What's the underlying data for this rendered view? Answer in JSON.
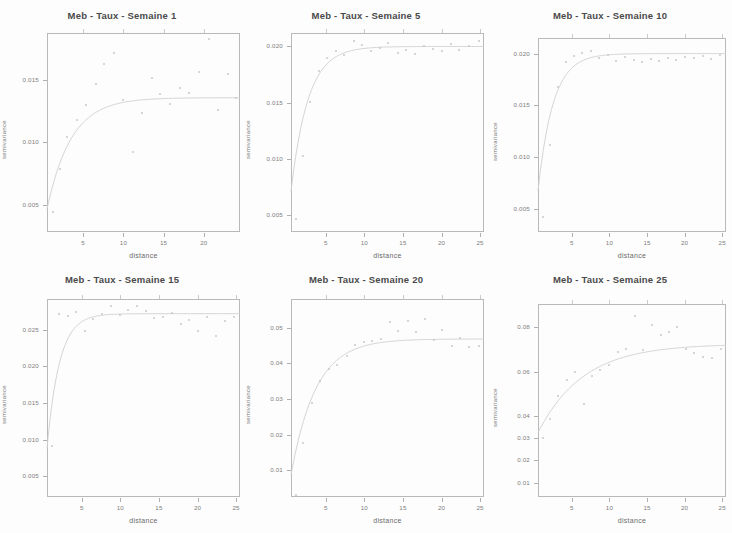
{
  "figure": {
    "background_color": "#fdfdfd",
    "layout": {
      "rows": 2,
      "cols": 3
    },
    "axis_color": "#b9b9b9",
    "point_color": "#c9c9c9",
    "line_color": "#cfcfcf"
  },
  "chart_data": [
    {
      "type": "scatter",
      "title": "Meb - Taux - Semaine 1",
      "xlabel": "distance",
      "ylabel": "semivariance",
      "xticks": [
        5,
        10,
        15,
        20
      ],
      "xtick_labels": [
        "5",
        "10",
        "15",
        "20"
      ],
      "yticks": [
        0.005,
        0.01,
        0.015
      ],
      "ytick_labels": [
        "0.005",
        "0.010",
        "0.015"
      ],
      "xlim": [
        0.5,
        24.5
      ],
      "ylim": [
        0.0028,
        0.0188
      ],
      "grid": false,
      "legend": "none",
      "points": {
        "x": [
          1.2,
          2.1,
          3.0,
          4.2,
          5.4,
          6.6,
          7.6,
          8.8,
          10.0,
          11.2,
          12.3,
          13.5,
          14.6,
          15.8,
          17.0,
          18.2,
          19.4,
          20.6,
          21.8,
          23.0,
          24.0
        ],
        "y": [
          0.0044,
          0.0079,
          0.0104,
          0.0118,
          0.013,
          0.0147,
          0.0163,
          0.0172,
          0.0134,
          0.0092,
          0.0124,
          0.0152,
          0.0139,
          0.0131,
          0.0144,
          0.014,
          0.0157,
          0.0183,
          0.0126,
          0.0155,
          0.0136
        ]
      },
      "fitted_curve": {
        "model": "exponential",
        "nugget": 0.003,
        "sill": 0.0136,
        "range": 3.0
      }
    },
    {
      "type": "scatter",
      "title": "Meb - Taux - Semaine 5",
      "xlabel": "distance",
      "ylabel": "semivariance",
      "xticks": [
        5,
        10,
        15,
        20,
        25
      ],
      "xtick_labels": [
        "5",
        "10",
        "15",
        "20",
        "25"
      ],
      "yticks": [
        0.005,
        0.01,
        0.015,
        0.02
      ],
      "ytick_labels": [
        "0.005",
        "0.010",
        "0.015",
        "0.020"
      ],
      "xlim": [
        0.5,
        25.5
      ],
      "ylim": [
        0.0035,
        0.0212
      ],
      "grid": false,
      "legend": "none",
      "points": {
        "x": [
          1.1,
          2.0,
          3.0,
          4.1,
          5.2,
          6.3,
          7.4,
          8.6,
          9.7,
          10.9,
          12.0,
          13.1,
          14.3,
          15.4,
          16.6,
          17.7,
          18.9,
          20.0,
          21.2,
          22.3,
          23.5,
          24.8
        ],
        "y": [
          0.0047,
          0.0103,
          0.0151,
          0.0178,
          0.019,
          0.0196,
          0.0192,
          0.0205,
          0.0201,
          0.0196,
          0.0199,
          0.0203,
          0.0194,
          0.0197,
          0.0193,
          0.02,
          0.0198,
          0.0196,
          0.0202,
          0.0197,
          0.02,
          0.0205
        ]
      },
      "fitted_curve": {
        "model": "exponential",
        "nugget": 0.0038,
        "sill": 0.02,
        "range": 2.2
      }
    },
    {
      "type": "scatter",
      "title": "Meb - Taux - Semaine 10",
      "xlabel": "distance",
      "ylabel": "semivariance",
      "xticks": [
        5,
        10,
        15,
        20,
        25
      ],
      "xtick_labels": [
        "5",
        "10",
        "15",
        "20",
        "25"
      ],
      "yticks": [
        0.005,
        0.01,
        0.015,
        0.02
      ],
      "ytick_labels": [
        "0.005",
        "0.010",
        "0.015",
        "0.020"
      ],
      "xlim": [
        0.5,
        25.5
      ],
      "ylim": [
        0.0028,
        0.0215
      ],
      "grid": false,
      "legend": "none",
      "points": {
        "x": [
          1.1,
          2.1,
          3.1,
          4.2,
          5.3,
          6.4,
          7.5,
          8.6,
          9.8,
          10.9,
          12.1,
          13.2,
          14.3,
          15.5,
          16.6,
          17.8,
          18.9,
          20.1,
          21.2,
          22.4,
          23.5,
          24.7
        ],
        "y": [
          0.0042,
          0.0112,
          0.0168,
          0.0192,
          0.0198,
          0.0201,
          0.0202,
          0.0196,
          0.0199,
          0.0193,
          0.0197,
          0.0194,
          0.0192,
          0.0195,
          0.0193,
          0.0196,
          0.0194,
          0.0197,
          0.0196,
          0.0198,
          0.0195,
          0.0199
        ]
      },
      "fitted_curve": {
        "model": "exponential",
        "nugget": 0.003,
        "sill": 0.02,
        "range": 2.0
      }
    },
    {
      "type": "scatter",
      "title": "Meb - Taux - Semaine 15",
      "xlabel": "distance",
      "ylabel": "semivariance",
      "xticks": [
        5,
        10,
        15,
        20,
        25
      ],
      "xtick_labels": [
        "5",
        "10",
        "15",
        "20",
        "25"
      ],
      "yticks": [
        0.005,
        0.01,
        0.015,
        0.02,
        0.025
      ],
      "ytick_labels": [
        "0.005",
        "0.010",
        "0.015",
        "0.020",
        "0.025"
      ],
      "xlim": [
        0.5,
        25.5
      ],
      "ylim": [
        0.0022,
        0.0292
      ],
      "grid": false,
      "legend": "none",
      "points": {
        "x": [
          1.1,
          2.1,
          3.2,
          4.3,
          5.4,
          6.5,
          7.6,
          8.8,
          9.9,
          11.0,
          12.1,
          13.3,
          14.4,
          15.5,
          16.7,
          17.8,
          18.9,
          20.1,
          21.2,
          22.4,
          23.5,
          24.7
        ],
        "y": [
          0.0091,
          0.0271,
          0.0269,
          0.0274,
          0.0249,
          0.0265,
          0.0272,
          0.0283,
          0.027,
          0.0277,
          0.0283,
          0.0275,
          0.0266,
          0.0268,
          0.0273,
          0.0258,
          0.0263,
          0.0249,
          0.0268,
          0.0242,
          0.0262,
          0.0267
        ]
      },
      "fitted_curve": {
        "model": "exponential",
        "nugget": 0.002,
        "sill": 0.0272,
        "range": 1.6
      }
    },
    {
      "type": "scatter",
      "title": "Meb - Taux - Semaine 20",
      "xlabel": "distance",
      "ylabel": "semivariance",
      "xticks": [
        5,
        10,
        15,
        20,
        25
      ],
      "xtick_labels": [
        "5",
        "10",
        "15",
        "20",
        "25"
      ],
      "yticks": [
        0.01,
        0.02,
        0.03,
        0.04,
        0.05
      ],
      "ytick_labels": [
        "0.01",
        "0.02",
        "0.03",
        "0.04",
        "0.05"
      ],
      "xlim": [
        0.5,
        25.5
      ],
      "ylim": [
        0.0025,
        0.058
      ],
      "grid": false,
      "legend": "none",
      "points": {
        "x": [
          1.1,
          2.1,
          3.2,
          4.3,
          5.4,
          6.5,
          7.7,
          8.8,
          9.9,
          11.0,
          12.2,
          13.3,
          14.4,
          15.6,
          16.7,
          17.8,
          19.0,
          20.1,
          21.3,
          22.4,
          23.6,
          24.8
        ],
        "y": [
          0.003,
          0.0175,
          0.0288,
          0.035,
          0.0384,
          0.0396,
          0.0421,
          0.0452,
          0.046,
          0.0463,
          0.0468,
          0.0515,
          0.0489,
          0.0518,
          0.0487,
          0.0525,
          0.0466,
          0.0492,
          0.0447,
          0.047,
          0.0445,
          0.0447
        ]
      },
      "fitted_curve": {
        "model": "exponential",
        "nugget": 0.0022,
        "sill": 0.0468,
        "range": 3.2
      }
    },
    {
      "type": "scatter",
      "title": "Meb - Taux - Semaine 25",
      "xlabel": "distance",
      "ylabel": "semivariance",
      "xticks": [
        5,
        10,
        15,
        20,
        25
      ],
      "xtick_labels": [
        "5",
        "10",
        "15",
        "20",
        "25"
      ],
      "yticks": [
        0.01,
        0.02,
        0.03,
        0.04,
        0.06,
        0.08
      ],
      "ytick_labels": [
        "0.01",
        "0.02",
        "0.03",
        "0.04",
        "0.06",
        "0.08"
      ],
      "xlim": [
        0.5,
        25.5
      ],
      "ylim": [
        0.0035,
        0.0905
      ],
      "grid": false,
      "legend": "none",
      "points": {
        "x": [
          1.1,
          2.1,
          3.2,
          4.3,
          5.4,
          6.6,
          7.7,
          8.8,
          10.0,
          11.1,
          12.2,
          13.4,
          14.5,
          15.6,
          16.8,
          17.9,
          19.0,
          20.2,
          21.3,
          22.5,
          23.6,
          24.8
        ],
        "y": [
          0.03,
          0.0385,
          0.049,
          0.0562,
          0.06,
          0.0455,
          0.058,
          0.0607,
          0.0628,
          0.069,
          0.0702,
          0.085,
          0.0697,
          0.081,
          0.0765,
          0.078,
          0.08,
          0.0703,
          0.0685,
          0.0664,
          0.066,
          0.07
        ]
      },
      "fitted_curve": {
        "model": "exponential",
        "nugget": 0.029,
        "sill": 0.0725,
        "range": 6.0
      }
    }
  ]
}
